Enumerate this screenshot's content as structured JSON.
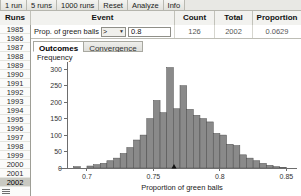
{
  "toolbar": {
    "buttons": [
      {
        "label": "1 run",
        "name": "run-1-button"
      },
      {
        "label": "5 runs",
        "name": "run-5-button"
      },
      {
        "label": "1000 runs",
        "name": "run-1000-button"
      },
      {
        "label": "Reset",
        "name": "reset-button"
      },
      {
        "label": "Analyze",
        "name": "analyze-button"
      },
      {
        "label": "Info",
        "name": "info-button"
      }
    ]
  },
  "table": {
    "headers": {
      "runs": "Runs",
      "event": "Event",
      "count": "Count",
      "total": "Total",
      "proportion": "Proportion"
    },
    "event_row": {
      "label": "Prop. of green balls",
      "operator": ">",
      "operator_options": [
        ">",
        "<",
        "=",
        "≥",
        "≤"
      ],
      "value": "0.8",
      "count": "126",
      "total": "2002",
      "proportion": "0.0629"
    },
    "runs": [
      "1985",
      "1986",
      "1987",
      "1988",
      "1989",
      "1990",
      "1991",
      "1992",
      "1993",
      "1994",
      "1995",
      "1996",
      "1997",
      "1998",
      "1999",
      "2000",
      "2001",
      "2002"
    ],
    "selected_run": "2002"
  },
  "tabs": [
    {
      "label": "Outcomes",
      "name": "tab-outcomes",
      "active": true
    },
    {
      "label": "Convergence",
      "name": "tab-convergence",
      "active": false
    }
  ],
  "chart_data": {
    "type": "bar",
    "title": "",
    "xlabel": "Proportion of green balls",
    "ylabel": "Frequency",
    "xlim": [
      0.685,
      0.858
    ],
    "ylim": [
      0,
      310
    ],
    "xticks": [
      0.7,
      0.75,
      0.8,
      0.85
    ],
    "xtick_labels": [
      "0.7",
      "0.75",
      "0.8",
      "0.85"
    ],
    "yticks": [
      0,
      50,
      100,
      150,
      200,
      250,
      300
    ],
    "ytick_labels": [
      "0",
      "50",
      "100",
      "150",
      "200",
      "250",
      "300"
    ],
    "grid": false,
    "legend": false,
    "bin_width": 0.005,
    "bin_starts": [
      0.69,
      0.695,
      0.7,
      0.705,
      0.71,
      0.715,
      0.72,
      0.725,
      0.73,
      0.735,
      0.74,
      0.745,
      0.75,
      0.755,
      0.76,
      0.765,
      0.77,
      0.775,
      0.78,
      0.785,
      0.79,
      0.795,
      0.8,
      0.805,
      0.81,
      0.815,
      0.82,
      0.825,
      0.83,
      0.835,
      0.84,
      0.845
    ],
    "categories": [
      "0.690",
      "0.695",
      "0.700",
      "0.705",
      "0.710",
      "0.715",
      "0.720",
      "0.725",
      "0.730",
      "0.735",
      "0.740",
      "0.745",
      "0.750",
      "0.755",
      "0.760",
      "0.765",
      "0.770",
      "0.775",
      "0.780",
      "0.785",
      "0.790",
      "0.795",
      "0.800",
      "0.805",
      "0.810",
      "0.815",
      "0.820",
      "0.825",
      "0.830",
      "0.835",
      "0.840",
      "0.845"
    ],
    "values": [
      4,
      0,
      6,
      10,
      14,
      22,
      30,
      44,
      62,
      85,
      100,
      150,
      205,
      168,
      305,
      180,
      250,
      178,
      160,
      150,
      140,
      105,
      100,
      72,
      68,
      40,
      30,
      22,
      14,
      8,
      4,
      2
    ],
    "marker_x": 0.7655,
    "marker_label": ""
  }
}
